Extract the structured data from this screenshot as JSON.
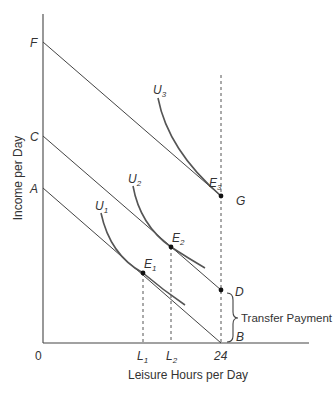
{
  "diagram": {
    "y_axis_label": "Income per Day",
    "x_axis_label": "Leisure Hours per Day",
    "origin_label": "0",
    "x_ticks": {
      "l1": "L",
      "l1_sub": "1",
      "l2": "L",
      "l2_sub": "2",
      "max": "24"
    },
    "intercepts": {
      "f": "F",
      "c": "C",
      "a": "A"
    },
    "points": {
      "g": "G",
      "d": "D",
      "b": "B"
    },
    "equilibria": {
      "e1": "E",
      "e1_sub": "1",
      "e2": "E",
      "e2_sub": "2",
      "e3": "E",
      "e3_sub": "3"
    },
    "indifference_curves": {
      "u1": "U",
      "u1_sub": "1",
      "u2": "U",
      "u2_sub": "2",
      "u3": "U",
      "u3_sub": "3"
    },
    "brace_label": "Transfer Payment",
    "budget_lines": [
      {
        "name": "FG",
        "from": "F",
        "to": "G"
      },
      {
        "name": "CD",
        "from": "C",
        "to": "D"
      },
      {
        "name": "AB",
        "from": "A",
        "to": "B"
      }
    ]
  }
}
